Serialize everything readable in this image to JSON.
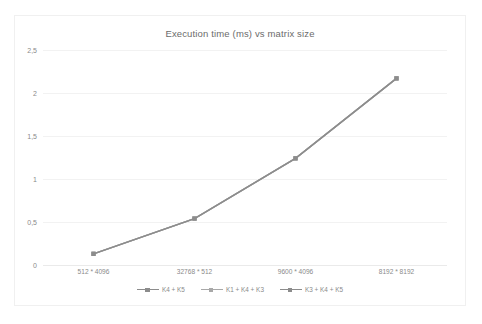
{
  "chart_data": {
    "type": "line",
    "title": "Execution time (ms) vs matrix size",
    "xlabel": "",
    "ylabel": "",
    "categories": [
      "512 * 4096",
      "32768 * 512",
      "9600 * 4096",
      "8192 * 8192"
    ],
    "series": [
      {
        "name": "K4 + K5",
        "values": [
          0.13,
          0.54,
          1.24,
          2.17
        ],
        "color": "#8c8c8c"
      },
      {
        "name": "K1 + K4 + K3",
        "values": [
          0.13,
          0.54,
          1.24,
          2.17
        ],
        "color": "#a8a8a8"
      },
      {
        "name": "K3 + K4 + K5",
        "values": [
          0.13,
          0.54,
          1.24,
          2.17
        ],
        "color": "#8c8c8c"
      }
    ],
    "ylim": [
      0,
      2.5
    ],
    "yticks": [
      0,
      0.5,
      1,
      1.5,
      2,
      2.5
    ],
    "ytick_labels": [
      "0",
      "0,5",
      "1",
      "1,5",
      "2",
      "2,5"
    ],
    "grid": true,
    "legend_position": "bottom",
    "marker": "square",
    "decimal_separator": ","
  }
}
